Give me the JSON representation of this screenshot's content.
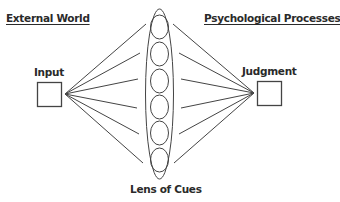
{
  "diagram": {
    "headings": {
      "left": "External World",
      "right": "Psychological Processes"
    },
    "nodes": {
      "input": "Input",
      "judgment": "Judgment"
    },
    "lens_label": "Lens of Cues",
    "cue_count": 6,
    "colors": {
      "stroke": "#444444",
      "text": "#2a2a2a"
    }
  }
}
